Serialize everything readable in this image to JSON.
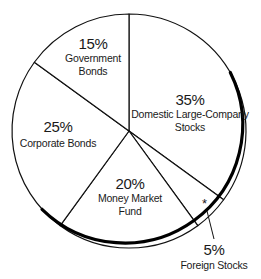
{
  "chart_data": {
    "type": "pie",
    "title": "",
    "start_angle_deg": 0,
    "direction": "clockwise",
    "slices": [
      {
        "label": "Domestic Large-Company Stocks",
        "label_lines": [
          "Domestic Large-Company",
          "Stocks"
        ],
        "value": 35,
        "pct_text": "35%"
      },
      {
        "label": "Foreign Stocks",
        "label_lines": [
          "Foreign Stocks"
        ],
        "value": 5,
        "pct_text": "5%",
        "marker": "*",
        "callout": true
      },
      {
        "label": "Money Market Fund",
        "label_lines": [
          "Money Market",
          "Fund"
        ],
        "value": 20,
        "pct_text": "20%"
      },
      {
        "label": "Corporate Bonds",
        "label_lines": [
          "Corporate Bonds"
        ],
        "value": 25,
        "pct_text": "25%"
      },
      {
        "label": "Government Bonds",
        "label_lines": [
          "Government",
          "Bonds"
        ],
        "value": 15,
        "pct_text": "15%"
      }
    ],
    "colors": {
      "fill": "#ffffff",
      "stroke": "#111111"
    },
    "legend": "none"
  }
}
